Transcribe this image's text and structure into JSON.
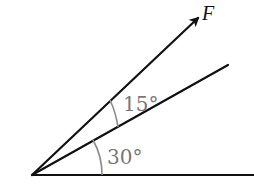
{
  "diagram": {
    "type": "force-angle-diagram",
    "force_label": "F",
    "angles": [
      {
        "label": "30°",
        "between": [
          "horizontal",
          "reference-line"
        ],
        "degrees": 30
      },
      {
        "label": "15°",
        "between": [
          "reference-line",
          "force-vector"
        ],
        "degrees": 15
      }
    ],
    "colors": {
      "lines": "#111111",
      "arcs": "#8a8a8a",
      "angle_labels": "#777777",
      "background": "#ffffff"
    }
  }
}
